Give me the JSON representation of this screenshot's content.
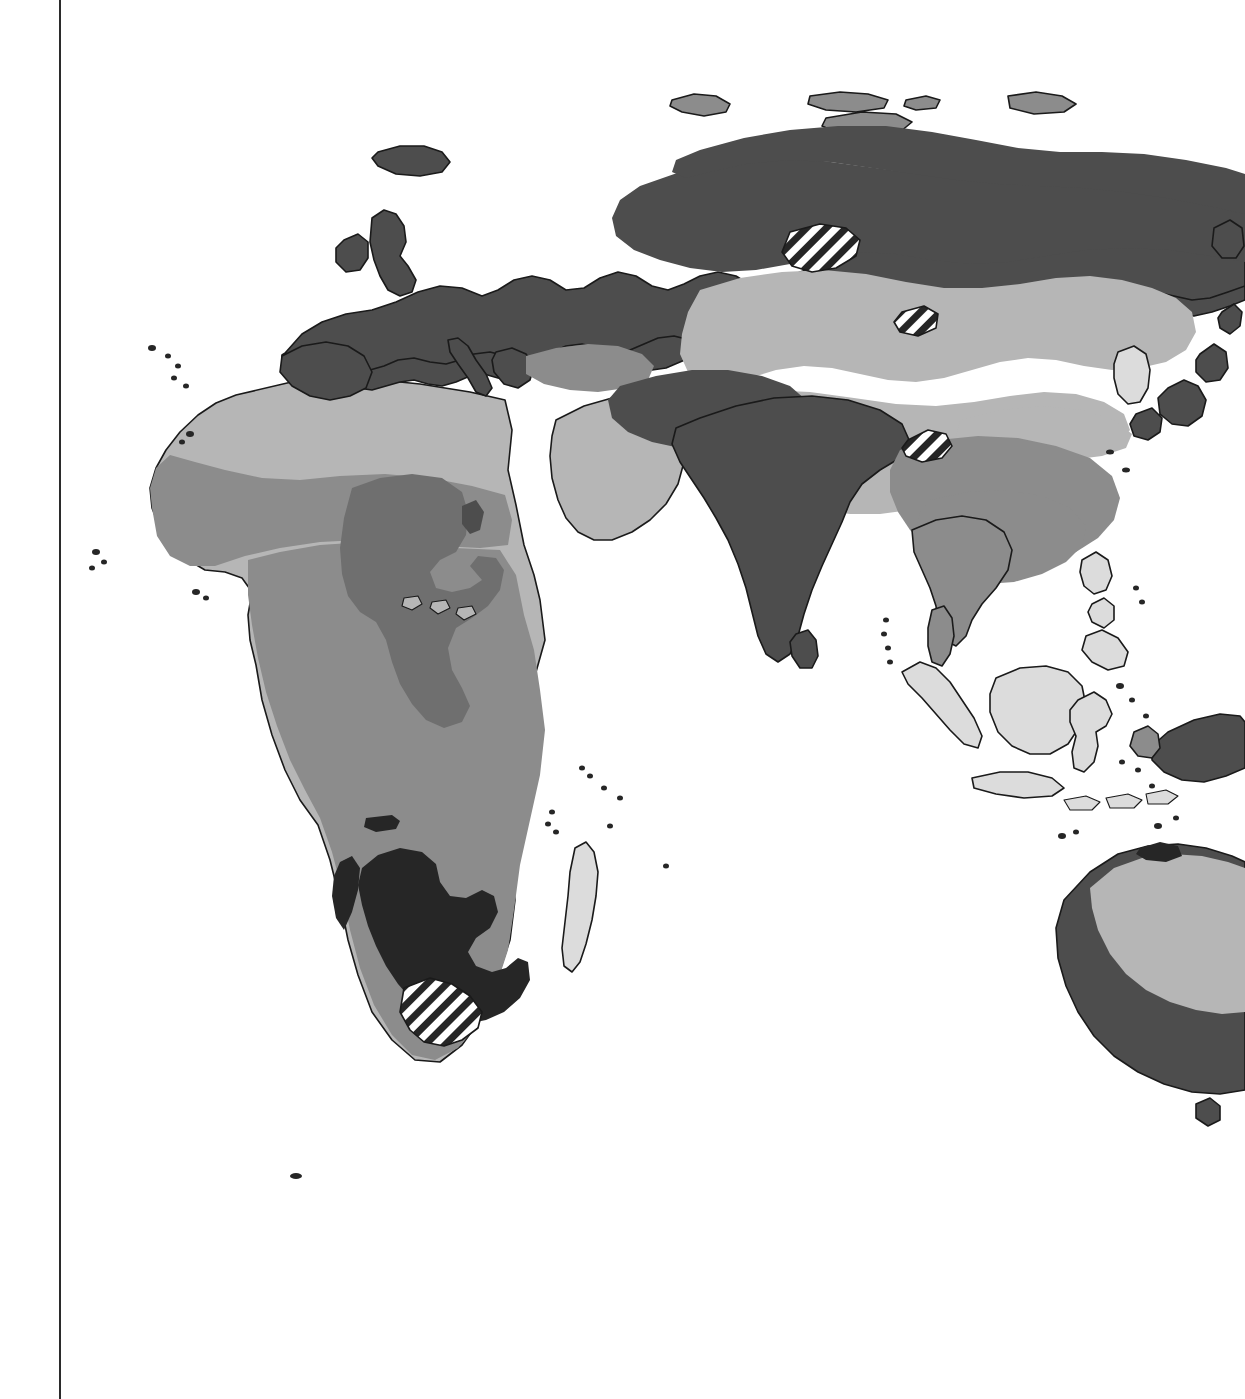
{
  "page": {
    "kind": "printed-atlas-page",
    "background_color": "#ffffff",
    "margin_rule_color": "#2b2b2b",
    "width_px": 1245,
    "height_px": 1399
  },
  "figure": {
    "name": "world-thematic-map",
    "outline_color": "#1a1a1a",
    "ocean_color": "#ffffff"
  },
  "legend_classes": [
    {
      "key": "class-very-light",
      "color": "#dcdcdc",
      "label": ""
    },
    {
      "key": "class-light",
      "color": "#b6b6b6",
      "label": ""
    },
    {
      "key": "class-medium",
      "color": "#8c8c8c",
      "label": ""
    },
    {
      "key": "class-dark",
      "color": "#4d4d4d",
      "label": ""
    },
    {
      "key": "class-very-dark",
      "color": "#262626",
      "label": ""
    },
    {
      "key": "class-hatched",
      "color": "#3a3a3a",
      "label": ""
    }
  ],
  "regions": [
    {
      "name": "europe",
      "class": "class-dark"
    },
    {
      "name": "scandinavia",
      "class": "class-dark"
    },
    {
      "name": "iceland",
      "class": "class-dark"
    },
    {
      "name": "british-isles",
      "class": "class-dark"
    },
    {
      "name": "iberia",
      "class": "class-dark"
    },
    {
      "name": "siberia",
      "class": "class-dark"
    },
    {
      "name": "arctic-islands",
      "class": "class-medium"
    },
    {
      "name": "central-asia",
      "class": "class-light"
    },
    {
      "name": "tibet",
      "class": "class-light"
    },
    {
      "name": "mongolia",
      "class": "class-light"
    },
    {
      "name": "anatolia",
      "class": "class-medium"
    },
    {
      "name": "arabia",
      "class": "class-light"
    },
    {
      "name": "iran",
      "class": "class-dark"
    },
    {
      "name": "india",
      "class": "class-dark"
    },
    {
      "name": "sri-lanka",
      "class": "class-dark"
    },
    {
      "name": "china",
      "class": "class-medium"
    },
    {
      "name": "indochina",
      "class": "class-medium"
    },
    {
      "name": "japan",
      "class": "class-dark"
    },
    {
      "name": "korea",
      "class": "class-very-light"
    },
    {
      "name": "indonesia",
      "class": "class-very-light"
    },
    {
      "name": "borneo",
      "class": "class-very-light"
    },
    {
      "name": "philippines",
      "class": "class-very-light"
    },
    {
      "name": "new-guinea",
      "class": "class-dark"
    },
    {
      "name": "sahara",
      "class": "class-light"
    },
    {
      "name": "sahel",
      "class": "class-medium"
    },
    {
      "name": "central-africa",
      "class": "class-medium"
    },
    {
      "name": "east-africa",
      "class": "class-dark"
    },
    {
      "name": "southern-africa",
      "class": "class-very-dark"
    },
    {
      "name": "cape-region",
      "class": "class-hatched"
    },
    {
      "name": "madagascar",
      "class": "class-very-light"
    },
    {
      "name": "australia-interior",
      "class": "class-light"
    },
    {
      "name": "australia-coast",
      "class": "class-dark"
    },
    {
      "name": "kazakh-hatch",
      "class": "class-hatched"
    },
    {
      "name": "tarim-hatch",
      "class": "class-hatched"
    },
    {
      "name": "caspian-hatch",
      "class": "class-hatched"
    }
  ]
}
